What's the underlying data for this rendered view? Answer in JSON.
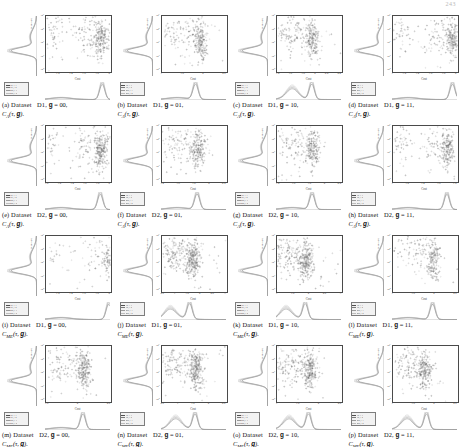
{
  "page": {
    "number": "243"
  },
  "figure": {
    "axis": {
      "xlabel": "Cost",
      "ylabel": "Suite size",
      "yticks": [
        "10⁶",
        "10⁵",
        "10⁴",
        "10³",
        "10²"
      ],
      "legend_entries": [
        {
          "label": "TR_i=1",
          "color": "#4f4f4f"
        },
        {
          "label": "TR_i=2",
          "color": "#7a7a7a"
        },
        {
          "label": "MR_i=1",
          "color": "#9a9a9a"
        },
        {
          "label": "MR_i=2",
          "color": "#bdbdbd"
        }
      ]
    },
    "panels": [
      {
        "letter": "(a)",
        "dataset": "D1",
        "g": "00",
        "cost_fn": "C",
        "cost_sub": "A",
        "xticks": [
          "1",
          "1.2",
          "1.4",
          "1.6",
          "1.8",
          "2"
        ],
        "caption_line1": "Dataset   D1,  g  =  00,",
        "caption_line2": "C_A(τ, g)."
      },
      {
        "letter": "(b)",
        "dataset": "D1",
        "g": "01",
        "cost_fn": "C",
        "cost_sub": "A",
        "xticks": [
          "1",
          "1.5",
          "2",
          "2.5"
        ],
        "caption_line1": "Dataset   D1,  g  =  01,",
        "caption_line2": "C_A(τ, g)."
      },
      {
        "letter": "(c)",
        "dataset": "D1",
        "g": "10",
        "cost_fn": "C",
        "cost_sub": "A",
        "xticks": [
          "1.4",
          "1.6",
          "1.8",
          "2",
          "2.2",
          "2.4"
        ],
        "caption_line1": "Dataset   D1,  g  =  10,",
        "caption_line2": "C_A(τ, g)."
      },
      {
        "letter": "(d)",
        "dataset": "D1",
        "g": "11",
        "cost_fn": "C",
        "cost_sub": "A",
        "xticks": [
          "1",
          "1.2",
          "1.4",
          "1.6",
          "1.8",
          "2"
        ],
        "caption_line1": "Dataset   D1,  g  =  11,",
        "caption_line2": "C_A(τ, g)."
      },
      {
        "letter": "(e)",
        "dataset": "D2",
        "g": "00",
        "cost_fn": "C",
        "cost_sub": "A",
        "xticks": [
          "1.0",
          "1.2",
          "1.4",
          "1.6",
          "1.8",
          "2"
        ],
        "caption_line1": "Dataset   D2,  g  =  00,",
        "caption_line2": "C_A(τ, g)."
      },
      {
        "letter": "(f)",
        "dataset": "D2",
        "g": "01",
        "cost_fn": "C",
        "cost_sub": "A",
        "xticks": [
          "1.4",
          "1.6",
          "1.8",
          "2",
          "2.2"
        ],
        "caption_line1": "Dataset   D2,  g  =  01,",
        "caption_line2": "C_A(τ, g)."
      },
      {
        "letter": "(g)",
        "dataset": "D2",
        "g": "10",
        "cost_fn": "C",
        "cost_sub": "A",
        "xticks": [
          "1.4",
          "1.6",
          "1.8",
          "2",
          "2.2"
        ],
        "caption_line1": "Dataset   D2,  g  =  10,",
        "caption_line2": "C_A(τ, g)."
      },
      {
        "letter": "(h)",
        "dataset": "D2",
        "g": "11",
        "cost_fn": "C",
        "cost_sub": "A",
        "xticks": [
          "1",
          "1.2",
          "1.4",
          "1.6",
          "1.8"
        ],
        "caption_line1": "Dataset   D2,  g  =  11,",
        "caption_line2": "C_A(τ, g)."
      },
      {
        "letter": "(i)",
        "dataset": "D1",
        "g": "00",
        "cost_fn": "C",
        "cost_sub": "ME",
        "xticks": [
          "1",
          "1.2",
          "1.4",
          "1.6",
          "1.8",
          "2"
        ],
        "caption_line1": "Dataset   D1,  g  =  00,",
        "caption_line2": "C_ME(τ, g)."
      },
      {
        "letter": "(j)",
        "dataset": "D1",
        "g": "01",
        "cost_fn": "C",
        "cost_sub": "ME",
        "xticks": [
          "0.5",
          "1",
          "1.5",
          "2",
          "2.5",
          "3"
        ],
        "caption_line1": "Dataset   D1,  g  =  01,",
        "caption_line2": "C_ME(τ, g)."
      },
      {
        "letter": "(k)",
        "dataset": "D1",
        "g": "10",
        "cost_fn": "C",
        "cost_sub": "ME",
        "xticks": [
          "1",
          "1.5",
          "2",
          "2.5",
          "3"
        ],
        "caption_line1": "Dataset   D1,  g  =  10,",
        "caption_line2": "C_ME(τ, g)."
      },
      {
        "letter": "(l)",
        "dataset": "D1",
        "g": "11",
        "cost_fn": "C",
        "cost_sub": "ME",
        "xticks": [
          "1",
          "1.5",
          "2",
          "2.5"
        ],
        "caption_line1": "Dataset   D1,  g  =  11,",
        "caption_line2": "C_ME(τ, g)."
      },
      {
        "letter": "(m)",
        "dataset": "D2",
        "g": "00",
        "cost_fn": "C",
        "cost_sub": "ME",
        "xticks": [
          "1.5",
          "2",
          "2.5"
        ],
        "caption_line1": "Dataset   D2,  g  =  00,",
        "caption_line2": "C_ME(τ, g)."
      },
      {
        "letter": "(n)",
        "dataset": "D2",
        "g": "01",
        "cost_fn": "C",
        "cost_sub": "ME",
        "xticks": [
          "0.5",
          "1",
          "1.5",
          "2",
          "2.5"
        ],
        "caption_line1": "Dataset   D2,  g  =  01,",
        "caption_line2": "C_ME(τ, g)."
      },
      {
        "letter": "(o)",
        "dataset": "D2",
        "g": "10",
        "cost_fn": "C",
        "cost_sub": "ME",
        "xticks": [
          "1",
          "1.5",
          "2",
          "2.5"
        ],
        "caption_line1": "Dataset   D2,  g  =  10,",
        "caption_line2": "C_ME(τ, g)."
      },
      {
        "letter": "(p)",
        "dataset": "D2",
        "g": "11",
        "cost_fn": "C",
        "cost_sub": "ME",
        "xticks": [
          "1",
          "1.5",
          "2",
          "2.5"
        ],
        "caption_line1": "Dataset   D2,  g  =  11,",
        "caption_line2": "C_ME(τ, g)."
      }
    ]
  },
  "chart_data": {
    "type": "scatter",
    "title": "",
    "xlabel": "Cost",
    "ylabel": "Suite size",
    "yscale": "log",
    "ylim": [
      100,
      1000000
    ],
    "grid": false,
    "legend_position": "bottom-left",
    "series_names": [
      "TR_i=1",
      "TR_i=2",
      "MR_i=1",
      "MR_i=2"
    ],
    "panels": [
      {
        "id": "a",
        "xlim": [
          1,
          2
        ],
        "n_points": 330,
        "cluster_x": 1.85,
        "cluster_y": 30000,
        "density_peak_x": 1.88,
        "density_modes": 1
      },
      {
        "id": "b",
        "xlim": [
          1,
          2.6
        ],
        "n_points": 300,
        "cluster_x": 1.95,
        "cluster_y": 20000,
        "density_peak_x": 1.85,
        "density_modes": 1
      },
      {
        "id": "c",
        "xlim": [
          1.4,
          2.4
        ],
        "n_points": 310,
        "cluster_x": 1.95,
        "cluster_y": 15000,
        "density_peak_x": 1.95,
        "density_modes": 2
      },
      {
        "id": "d",
        "xlim": [
          1,
          2
        ],
        "n_points": 320,
        "cluster_x": 1.92,
        "cluster_y": 25000,
        "density_peak_x": 1.93,
        "density_modes": 1
      },
      {
        "id": "e",
        "xlim": [
          1.0,
          2.0
        ],
        "n_points": 340,
        "cluster_x": 1.85,
        "cluster_y": 8000,
        "density_peak_x": 1.85,
        "density_modes": 1
      },
      {
        "id": "f",
        "xlim": [
          1.4,
          2.3
        ],
        "n_points": 300,
        "cluster_x": 1.9,
        "cluster_y": 6000,
        "density_peak_x": 1.9,
        "density_modes": 1
      },
      {
        "id": "g",
        "xlim": [
          1.4,
          2.3
        ],
        "n_points": 300,
        "cluster_x": 1.9,
        "cluster_y": 7000,
        "density_peak_x": 1.9,
        "density_modes": 1
      },
      {
        "id": "h",
        "xlim": [
          1,
          1.9
        ],
        "n_points": 310,
        "cluster_x": 1.75,
        "cluster_y": 9000,
        "density_peak_x": 1.76,
        "density_modes": 1
      },
      {
        "id": "i",
        "xlim": [
          1,
          2
        ],
        "n_points": 180,
        "cluster_x": 1.97,
        "cluster_y": 4000,
        "density_peak_x": 1.98,
        "density_modes": 1
      },
      {
        "id": "j",
        "xlim": [
          0.5,
          3
        ],
        "n_points": 420,
        "cluster_x": 1.7,
        "cluster_y": 9000,
        "density_peak_x": 1.6,
        "density_modes": 2
      },
      {
        "id": "k",
        "xlim": [
          1,
          3
        ],
        "n_points": 400,
        "cluster_x": 1.9,
        "cluster_y": 8000,
        "density_peak_x": 1.9,
        "density_modes": 2
      },
      {
        "id": "l",
        "xlim": [
          1,
          2.6
        ],
        "n_points": 260,
        "cluster_x": 2.0,
        "cluster_y": 5000,
        "density_peak_x": 2.0,
        "density_modes": 1
      },
      {
        "id": "m",
        "xlim": [
          1.4,
          2.6
        ],
        "n_points": 330,
        "cluster_x": 2.1,
        "cluster_y": 6000,
        "density_peak_x": 2.1,
        "density_modes": 1
      },
      {
        "id": "n",
        "xlim": [
          0.5,
          2.6
        ],
        "n_points": 400,
        "cluster_x": 1.6,
        "cluster_y": 7000,
        "density_peak_x": 1.6,
        "density_modes": 2
      },
      {
        "id": "o",
        "xlim": [
          1,
          2.6
        ],
        "n_points": 360,
        "cluster_x": 1.8,
        "cluster_y": 6500,
        "density_peak_x": 1.8,
        "density_modes": 2
      },
      {
        "id": "p",
        "xlim": [
          1,
          2.6
        ],
        "n_points": 340,
        "cluster_x": 1.8,
        "cluster_y": 6000,
        "density_peak_x": 1.85,
        "density_modes": 2
      }
    ]
  }
}
